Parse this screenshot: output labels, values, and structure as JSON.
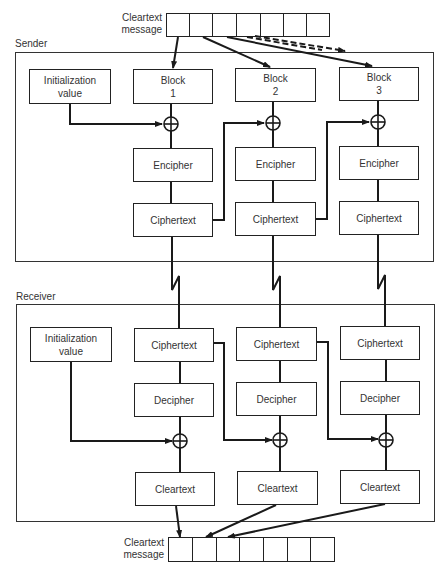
{
  "top_message": {
    "label_line1": "Cleartext",
    "label_line2": "message",
    "cell_count": 7
  },
  "bottom_message": {
    "label_line1": "Cleartext",
    "label_line2": "message",
    "cell_count": 7
  },
  "sender": {
    "label": "Sender",
    "init": {
      "line1": "Initialization",
      "line2": "value"
    },
    "columns": [
      {
        "block_line1": "Block",
        "block_line2": "1",
        "encipher": "Encipher",
        "ciphertext": "Ciphertext"
      },
      {
        "block_line1": "Block",
        "block_line2": "2",
        "encipher": "Encipher",
        "ciphertext": "Ciphertext"
      },
      {
        "block_line1": "Block",
        "block_line2": "3",
        "encipher": "Encipher",
        "ciphertext": "Ciphertext"
      }
    ]
  },
  "receiver": {
    "label": "Receiver",
    "init": {
      "line1": "Initialization",
      "line2": "value"
    },
    "columns": [
      {
        "ciphertext": "Ciphertext",
        "decipher": "Decipher",
        "cleartext": "Cleartext"
      },
      {
        "ciphertext": "Ciphertext",
        "decipher": "Decipher",
        "cleartext": "Cleartext"
      },
      {
        "ciphertext": "Ciphertext",
        "decipher": "Decipher",
        "cleartext": "Cleartext"
      }
    ]
  },
  "symbols": {
    "xor": "xor-operator",
    "link": "communication-link-lightning"
  },
  "colors": {
    "line": "#1a1a1a",
    "background": "#ffffff"
  }
}
